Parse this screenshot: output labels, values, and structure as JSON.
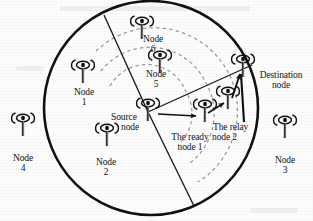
{
  "figure": {
    "type": "network-topology-diagram",
    "colors": {
      "ink": "#111111",
      "arc_dashed": "#9a9a9a",
      "sector_line": "#1a1a1a",
      "coverage_circle": "#111111",
      "background": "#fdfdfd"
    }
  },
  "coverage_area": {
    "name": "coverage-circle",
    "center": {
      "x": 151,
      "y": 108
    },
    "radius": 107
  },
  "nodes": [
    {
      "id": "node-1",
      "icon": "antenna-icon",
      "x": 83,
      "y": 74,
      "label_lines": [
        "Node",
        "1"
      ],
      "label_x": 83,
      "label_y": 88,
      "inside_circle": true
    },
    {
      "id": "node-2",
      "icon": "antenna-icon",
      "x": 107,
      "y": 137,
      "label_lines": [
        "Node",
        "2"
      ],
      "label_x": 107,
      "label_y": 151,
      "inside_circle": true
    },
    {
      "id": "node-3",
      "icon": "antenna-icon",
      "x": 285,
      "y": 129,
      "label_lines": [
        "Node",
        "3"
      ],
      "label_x": 285,
      "label_y": 172,
      "inside_circle": false
    },
    {
      "id": "node-4",
      "icon": "antenna-icon",
      "x": 23,
      "y": 127,
      "label_lines": [
        "Node",
        "4"
      ],
      "label_x": 23,
      "label_y": 170,
      "inside_circle": false
    },
    {
      "id": "node-5",
      "icon": "antenna-icon",
      "x": 160,
      "y": 64,
      "label_lines": [
        "Node",
        "5"
      ],
      "label_x": 161,
      "label_y": 78,
      "inside_circle": true
    },
    {
      "id": "node-6",
      "icon": "antenna-icon",
      "x": 142,
      "y": 30,
      "label_lines": [
        "Node",
        "6"
      ],
      "label_x": 150,
      "label_y": 43,
      "inside_circle": true
    },
    {
      "id": "source-node",
      "icon": "antenna-icon",
      "x": 148,
      "y": 112,
      "label_lines": [
        "Source",
        "node"
      ],
      "label_x": 117,
      "label_y": 118,
      "inside_circle": true
    },
    {
      "id": "ready-node-1",
      "icon": "antenna-icon",
      "x": 205,
      "y": 113,
      "label_lines": [
        "The ready",
        "node 1"
      ],
      "label_x": 190,
      "label_y": 141,
      "inside_circle": true
    },
    {
      "id": "relay-node-2",
      "icon": "antenna-icon",
      "x": 228,
      "y": 100,
      "label_lines": [
        "The relay",
        "node 2"
      ],
      "label_x": 233,
      "label_y": 128,
      "inside_circle": true
    },
    {
      "id": "destination-node",
      "icon": "antenna-icon",
      "x": 243,
      "y": 68,
      "label_lines": [
        "Destination",
        "node"
      ],
      "label_x": 279,
      "label_y": 80,
      "inside_circle": true
    }
  ],
  "labels": [
    {
      "name": "label-node-1",
      "line1": "Node",
      "line2": "1"
    },
    {
      "name": "label-node-2",
      "line1": "Node",
      "line2": "2"
    },
    {
      "name": "label-node-3",
      "line1": "Node",
      "line2": "3"
    },
    {
      "name": "label-node-4",
      "line1": "Node",
      "line2": "4"
    },
    {
      "name": "label-node-5",
      "line1": "Node",
      "line2": "5"
    },
    {
      "name": "label-node-6",
      "line1": "Node",
      "line2": "6"
    },
    {
      "name": "label-source-node",
      "line1": "Source",
      "line2": "node"
    },
    {
      "name": "label-ready-node-1",
      "line1": "The ready",
      "line2": "node 1"
    },
    {
      "name": "label-relay-node-2",
      "line1": "The relay",
      "line2": "node 2"
    },
    {
      "name": "label-destination-node",
      "line1": "Destination",
      "line2": "node"
    }
  ],
  "links": [
    {
      "id": "link-source-to-ready",
      "from": "source-node",
      "to": "ready-node-1",
      "style": "solid-arrow"
    },
    {
      "id": "link-ready-to-relay",
      "from": "ready-node-1",
      "to": "relay-node-2",
      "style": "solid-arrow"
    },
    {
      "id": "link-relay-to-destination",
      "from": "relay-node-2",
      "to": "destination-node",
      "style": "solid-arrow"
    },
    {
      "id": "link-source-to-destination",
      "from": "source-node",
      "to": "destination-node",
      "style": "solid-line"
    }
  ],
  "sector_lines": [
    {
      "id": "sector-line-upper-left",
      "from": {
        "x": 148,
        "y": 112
      },
      "to": {
        "x": 105,
        "y": 16
      }
    },
    {
      "id": "sector-line-upper-right",
      "from": {
        "x": 148,
        "y": 112
      },
      "to": {
        "x": 249,
        "y": 66
      }
    },
    {
      "id": "sector-line-lower-right",
      "from": {
        "x": 148,
        "y": 112
      },
      "to": {
        "x": 193,
        "y": 205
      }
    }
  ],
  "range_rings": [
    {
      "id": "range-ring-1",
      "radius": 42,
      "style": "dashed"
    },
    {
      "id": "range-ring-2",
      "radius": 62,
      "style": "dashed"
    },
    {
      "id": "range-ring-3",
      "radius": 84,
      "style": "dashed"
    }
  ]
}
